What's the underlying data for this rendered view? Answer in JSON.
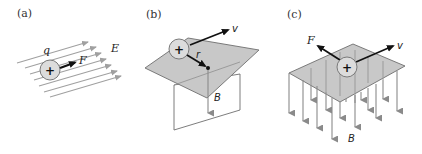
{
  "panels": [
    {
      "id": "a",
      "label": "(a)",
      "charge_symbol": "+",
      "charge_label": "q",
      "force_label": "F",
      "field_label": "E",
      "description": "Positive charge in uniform electric field; force along field"
    },
    {
      "id": "b",
      "label": "(b)",
      "charge_symbol": "+",
      "velocity_label": "v",
      "position_label": "r",
      "field_label": "B",
      "description": "Positive charge moving with velocity v above plane; field B at point r"
    },
    {
      "id": "c",
      "label": "(c)",
      "charge_symbol": "+",
      "force_label": "F",
      "velocity_label": "v",
      "field_label": "B",
      "description": "Positive charge moving through downward magnetic field; force perpendicular to v"
    }
  ],
  "colors": {
    "field_line": "#a0a0a0",
    "plane_fill": "#c8c8c8",
    "plane_stroke": "#6e6e6e",
    "charge_fill": "#dcdcdc",
    "charge_stroke": "#7a7a7a",
    "vector": "#111111",
    "text": "#222222"
  }
}
